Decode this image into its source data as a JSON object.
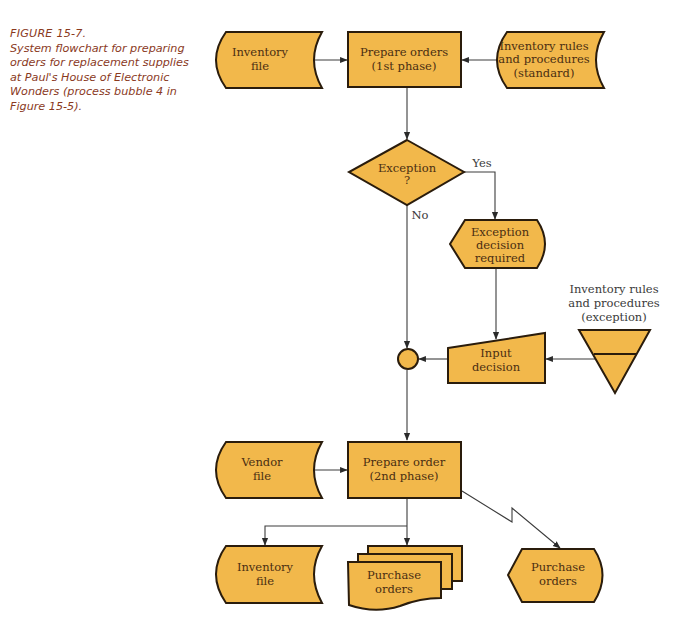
{
  "caption": {
    "figure_label": "FIGURE 15-7.",
    "text": "System flowchart for preparing orders for replacement supplies at Paul's House of Electronic Wonders (process bubble 4 in Figure 15-5)."
  },
  "colors": {
    "shape_fill": "#f2b84b",
    "shape_stroke": "#2a1c0c",
    "caption_text": "#8a3a1e",
    "label_text": "#4a2e12"
  },
  "nodes": {
    "inventory_file_top": {
      "type": "stored-data",
      "lines": [
        "Inventory",
        "file"
      ]
    },
    "prepare_orders_1": {
      "type": "process",
      "lines": [
        "Prepare orders",
        "(1st phase)"
      ]
    },
    "rules_standard": {
      "type": "stored-data",
      "lines": [
        "Inventory rules",
        "and procedures",
        "(standard)"
      ]
    },
    "exception_decision": {
      "type": "decision",
      "lines": [
        "Exception",
        "?"
      ]
    },
    "exception_display": {
      "type": "display",
      "lines": [
        "Exception",
        "decision",
        "required"
      ]
    },
    "connector": {
      "type": "connector"
    },
    "input_decision": {
      "type": "manual-input",
      "lines": [
        "Input",
        "decision"
      ]
    },
    "rules_exception": {
      "type": "offline-storage",
      "lines": [
        "Inventory rules",
        "and procedures",
        "(exception)"
      ]
    },
    "vendor_file": {
      "type": "stored-data",
      "lines": [
        "Vendor",
        "file"
      ]
    },
    "prepare_order_2": {
      "type": "process",
      "lines": [
        "Prepare order",
        "(2nd phase)"
      ]
    },
    "inventory_file_bottom": {
      "type": "stored-data",
      "lines": [
        "Inventory",
        "file"
      ]
    },
    "purchase_orders_docs": {
      "type": "multi-document",
      "lines": [
        "Purchase",
        "orders"
      ]
    },
    "purchase_orders_display": {
      "type": "display",
      "lines": [
        "Purchase",
        "orders"
      ]
    }
  },
  "edge_labels": {
    "yes": "Yes",
    "no": "No"
  },
  "edges": [
    {
      "from": "inventory_file_top",
      "to": "prepare_orders_1"
    },
    {
      "from": "rules_standard",
      "to": "prepare_orders_1"
    },
    {
      "from": "prepare_orders_1",
      "to": "exception_decision"
    },
    {
      "from": "exception_decision",
      "to": "exception_display",
      "label": "Yes"
    },
    {
      "from": "exception_decision",
      "to": "connector",
      "label": "No"
    },
    {
      "from": "exception_display",
      "to": "input_decision"
    },
    {
      "from": "rules_exception",
      "to": "input_decision"
    },
    {
      "from": "input_decision",
      "to": "connector"
    },
    {
      "from": "connector",
      "to": "prepare_order_2"
    },
    {
      "from": "vendor_file",
      "to": "prepare_order_2"
    },
    {
      "from": "prepare_order_2",
      "to": "inventory_file_bottom"
    },
    {
      "from": "prepare_order_2",
      "to": "purchase_orders_docs"
    },
    {
      "from": "prepare_order_2",
      "to": "purchase_orders_display",
      "style": "communication-link"
    }
  ]
}
